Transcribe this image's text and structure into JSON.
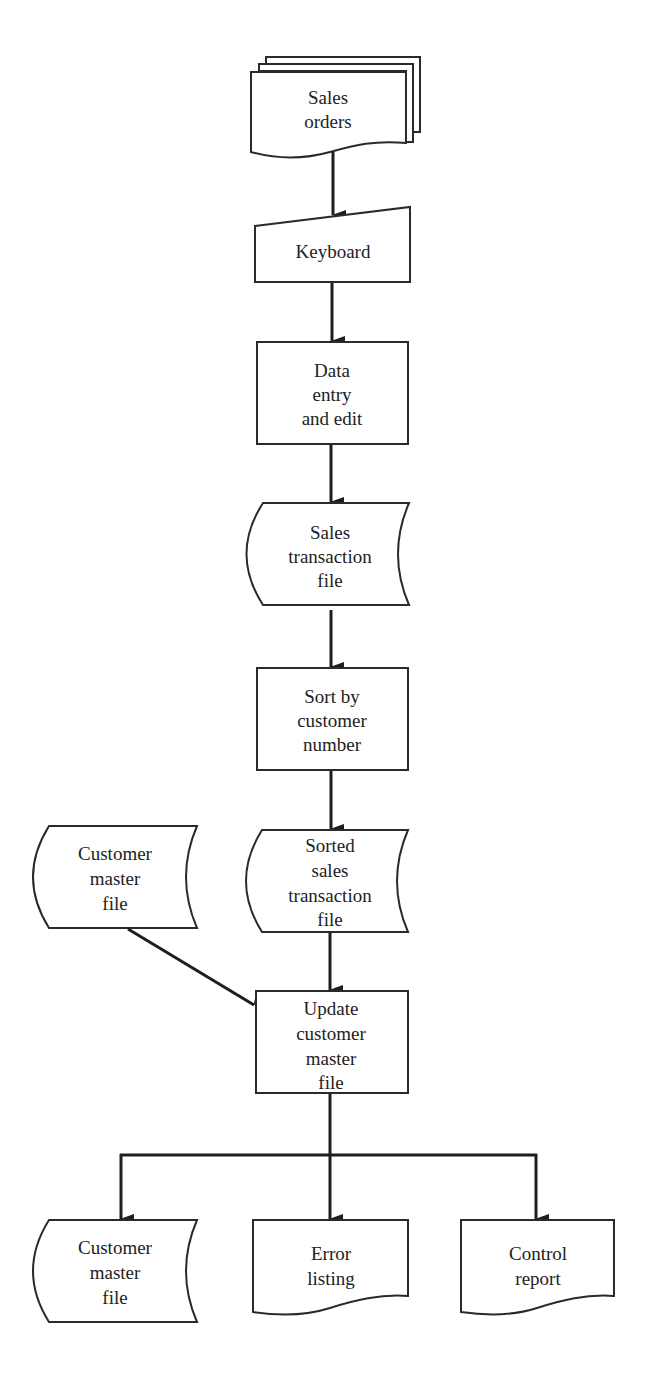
{
  "diagram": {
    "type": "system-flowchart",
    "colors": {
      "stroke": "#2a2a2a",
      "fill": "#ffffff",
      "text": "#222222"
    },
    "nodes": [
      {
        "id": "sales_orders",
        "shape": "multiple-documents",
        "lines": [
          "Sales",
          "orders"
        ]
      },
      {
        "id": "keyboard",
        "shape": "manual-input",
        "lines": [
          "Keyboard"
        ]
      },
      {
        "id": "data_entry",
        "shape": "process",
        "lines": [
          "Data",
          "entry",
          "and edit"
        ]
      },
      {
        "id": "sales_transaction_file",
        "shape": "offline-storage",
        "lines": [
          "Sales",
          "transaction",
          "file"
        ]
      },
      {
        "id": "sort",
        "shape": "process",
        "lines": [
          "Sort by",
          "customer",
          "number"
        ]
      },
      {
        "id": "customer_master_in",
        "shape": "offline-storage",
        "lines": [
          "Customer",
          "master",
          "file"
        ]
      },
      {
        "id": "sorted_file",
        "shape": "offline-storage",
        "lines": [
          "Sorted",
          "sales",
          "transaction",
          "file"
        ]
      },
      {
        "id": "update",
        "shape": "process",
        "lines": [
          "Update",
          "customer",
          "master",
          "file"
        ]
      },
      {
        "id": "customer_master_out",
        "shape": "offline-storage",
        "lines": [
          "Customer",
          "master",
          "file"
        ]
      },
      {
        "id": "error_listing",
        "shape": "document",
        "lines": [
          "Error",
          "listing"
        ]
      },
      {
        "id": "control_report",
        "shape": "document",
        "lines": [
          "Control",
          "report"
        ]
      }
    ],
    "edges": [
      {
        "from": "sales_orders",
        "to": "keyboard"
      },
      {
        "from": "keyboard",
        "to": "data_entry"
      },
      {
        "from": "data_entry",
        "to": "sales_transaction_file"
      },
      {
        "from": "sales_transaction_file",
        "to": "sort"
      },
      {
        "from": "sort",
        "to": "sorted_file"
      },
      {
        "from": "sorted_file",
        "to": "update"
      },
      {
        "from": "customer_master_in",
        "to": "update"
      },
      {
        "from": "update",
        "to": "customer_master_out"
      },
      {
        "from": "update",
        "to": "error_listing"
      },
      {
        "from": "update",
        "to": "control_report"
      }
    ]
  }
}
